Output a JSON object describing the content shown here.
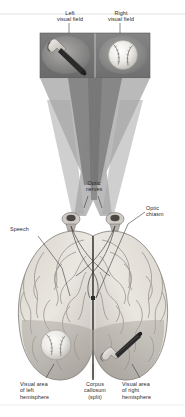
{
  "figure": {
    "background_color": "#ffffff"
  },
  "labels": {
    "left_visual_field": "Left\nvisual field",
    "right_visual_field": "Right\nvisual field",
    "optic_nerves": "Optic\nnerves",
    "optic_chiasm": "Optic\nchiasm",
    "speech": "Speech",
    "visual_area_left": "Visual area\nof left\nhemisphere",
    "corpus_callosum": "Corpus\ncallosum\n(split)",
    "visual_area_right": "Visual area\nof right\nhemisphere"
  },
  "objects": {
    "left_field_object": "hammer",
    "right_field_object": "baseball",
    "left_hemisphere_object": "baseball",
    "right_hemisphere_object": "hammer"
  },
  "colors": {
    "panel_dark": "#6e6e6e",
    "panel_mid": "#8b8b8b",
    "cone_light": "#b9b9b9",
    "cone_dark": "#8d8d8d",
    "brain_light": "#e9e6e0",
    "brain_mid": "#bdb9b2",
    "brain_dark": "#8f8b85",
    "text": "#2b2b2b",
    "leader_line": "#3a3a3a",
    "rule": "#cfcfcf"
  }
}
